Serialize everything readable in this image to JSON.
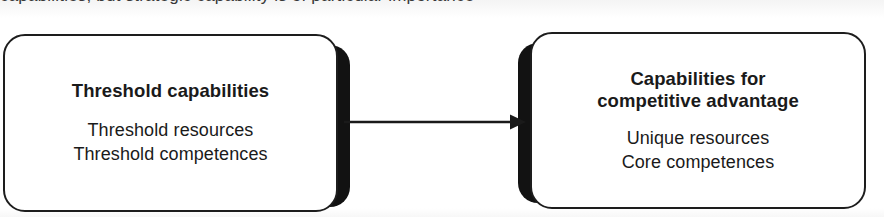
{
  "figure": {
    "type": "flow-diagram",
    "background_color": "#ffffff",
    "ink_color": "#1a1a1a",
    "shadow_color": "#121212",
    "clipped_top_line": "capabilities, but strategic capability is of particular importance"
  },
  "nodes": [
    {
      "id": "threshold",
      "title": "Threshold capabilities",
      "body": [
        "Threshold resources",
        "Threshold competences"
      ]
    },
    {
      "id": "advantage",
      "title_lines": [
        "Capabilities for",
        "competitive advantage"
      ],
      "body": [
        "Unique resources",
        "Core competences"
      ]
    }
  ],
  "connector": {
    "kind": "arrow",
    "direction": "right",
    "from": "threshold",
    "to": "advantage",
    "label": ""
  }
}
